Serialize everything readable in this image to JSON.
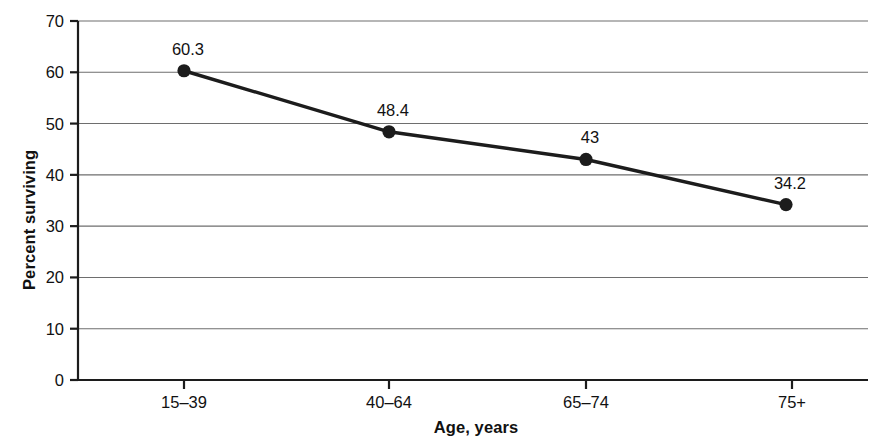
{
  "chart_data": {
    "type": "line",
    "title": "",
    "subtitle": "",
    "xlabel": "Age, years",
    "ylabel": "Percent surviving",
    "categories": [
      "15–39",
      "40–64",
      "65–74",
      "75+"
    ],
    "values": [
      60.3,
      48.4,
      43,
      34.2
    ],
    "point_labels": [
      "60.3",
      "48.4",
      "43",
      "34.2"
    ],
    "series": [
      {
        "name": "Percent surviving",
        "values": [
          60.3,
          48.4,
          43,
          34.2
        ]
      }
    ],
    "ylim": [
      0,
      70
    ],
    "ytick_step": 10,
    "ytick_labels": [
      "0",
      "10",
      "20",
      "30",
      "40",
      "50",
      "60",
      "70"
    ],
    "ytick_values": [
      0,
      10,
      20,
      30,
      40,
      50,
      60,
      70
    ],
    "xtick_labels": [
      "15–39",
      "40–64",
      "65–74",
      "75+"
    ],
    "grid": "horizontal",
    "legend": "none",
    "line_color": "#1c1c1c",
    "marker_color": "#1c1c1c",
    "grid_color": "#6e6e6e",
    "axis_color": "#1c1c1c",
    "background_color": "#ffffff"
  },
  "geometry": {
    "plot_left": 78,
    "plot_right": 868,
    "plot_top": 21,
    "plot_bottom": 380,
    "point_x": [
      184,
      389,
      586,
      786
    ],
    "tick_x": [
      184,
      389,
      586,
      792
    ],
    "label_font_size": 16.5,
    "tick_font_size": 16.5,
    "marker_radius": 6.6,
    "line_width": 3.4,
    "grid_width": 1.1,
    "axis_width": 2.2
  }
}
